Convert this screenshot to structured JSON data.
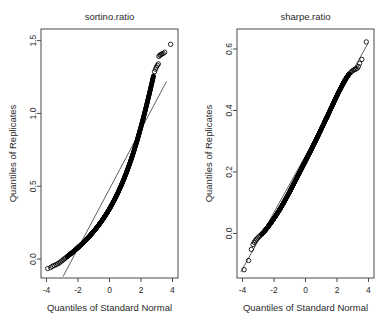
{
  "figure": {
    "background": "#ffffff",
    "point_color": "#000000",
    "line_color": "#1a1a1a",
    "axis_color": "#4a4a4a",
    "text_color": "#2b2b2b"
  },
  "chart_data": [
    {
      "type": "scatter",
      "plot_kind": "qq-plot",
      "title": "sortino.ratio",
      "xlabel": "Quantiles of Standard Normal",
      "ylabel": "Quantiles of Replicates",
      "xlim": [
        -4.35,
        4.35
      ],
      "ylim": [
        -0.13,
        1.58
      ],
      "xticks": [
        -4,
        -2,
        0,
        2,
        4
      ],
      "xticklabels": [
        "-4",
        "-2",
        "0",
        "2",
        "4"
      ],
      "yticks": [
        0.0,
        0.5,
        1.0,
        1.5
      ],
      "yticklabels": [
        "0.0",
        "0.5",
        "1.0",
        "1.5"
      ],
      "grid": false,
      "legend": null,
      "reference_line": {
        "x": [
          -2.95,
          3.62
        ],
        "y": [
          -0.12,
          1.22
        ]
      },
      "points": [
        [
          -3.92,
          -0.065
        ],
        [
          -3.74,
          -0.058
        ],
        [
          -3.62,
          -0.05
        ],
        [
          -3.52,
          -0.044
        ],
        [
          -3.4,
          -0.039
        ],
        [
          -3.3,
          -0.033
        ],
        [
          -3.21,
          -0.027
        ],
        [
          -3.12,
          -0.02
        ],
        [
          -3.02,
          -0.012
        ],
        [
          -2.94,
          -0.005
        ],
        [
          -2.86,
          0.002
        ],
        [
          -2.78,
          0.009
        ],
        [
          -2.7,
          0.016
        ],
        [
          -2.62,
          0.023
        ],
        [
          -2.54,
          0.03
        ],
        [
          -2.46,
          0.037
        ],
        [
          -2.38,
          0.044
        ],
        [
          -2.3,
          0.051
        ],
        [
          -2.22,
          0.058
        ],
        [
          -2.14,
          0.066
        ],
        [
          -2.06,
          0.073
        ],
        [
          -1.98,
          0.081
        ],
        [
          -1.9,
          0.089
        ],
        [
          -1.82,
          0.097
        ],
        [
          -1.74,
          0.105
        ],
        [
          -1.66,
          0.113
        ],
        [
          -1.58,
          0.122
        ],
        [
          -1.5,
          0.131
        ],
        [
          -1.42,
          0.14
        ],
        [
          -1.34,
          0.149
        ],
        [
          -1.26,
          0.158
        ],
        [
          -1.18,
          0.168
        ],
        [
          -1.1,
          0.178
        ],
        [
          -1.02,
          0.188
        ],
        [
          -0.94,
          0.198
        ],
        [
          -0.86,
          0.209
        ],
        [
          -0.78,
          0.22
        ],
        [
          -0.7,
          0.231
        ],
        [
          -0.62,
          0.243
        ],
        [
          -0.54,
          0.255
        ],
        [
          -0.46,
          0.267
        ],
        [
          -0.38,
          0.28
        ],
        [
          -0.3,
          0.293
        ],
        [
          -0.22,
          0.306
        ],
        [
          -0.14,
          0.32
        ],
        [
          -0.06,
          0.334
        ],
        [
          0.02,
          0.349
        ],
        [
          0.1,
          0.364
        ],
        [
          0.18,
          0.38
        ],
        [
          0.26,
          0.396
        ],
        [
          0.34,
          0.413
        ],
        [
          0.42,
          0.43
        ],
        [
          0.5,
          0.448
        ],
        [
          0.58,
          0.466
        ],
        [
          0.66,
          0.485
        ],
        [
          0.74,
          0.505
        ],
        [
          0.82,
          0.525
        ],
        [
          0.9,
          0.546
        ],
        [
          0.98,
          0.568
        ],
        [
          1.06,
          0.59
        ],
        [
          1.14,
          0.613
        ],
        [
          1.22,
          0.637
        ],
        [
          1.3,
          0.661
        ],
        [
          1.38,
          0.686
        ],
        [
          1.46,
          0.712
        ],
        [
          1.54,
          0.739
        ],
        [
          1.62,
          0.767
        ],
        [
          1.7,
          0.795
        ],
        [
          1.78,
          0.824
        ],
        [
          1.86,
          0.854
        ],
        [
          1.94,
          0.885
        ],
        [
          2.02,
          0.917
        ],
        [
          2.1,
          0.949
        ],
        [
          2.18,
          0.982
        ],
        [
          2.26,
          1.016
        ],
        [
          2.34,
          1.051
        ],
        [
          2.42,
          1.086
        ],
        [
          2.5,
          1.122
        ],
        [
          2.58,
          1.158
        ],
        [
          2.66,
          1.195
        ],
        [
          2.74,
          1.232
        ],
        [
          2.8,
          1.262
        ],
        [
          2.86,
          1.287
        ],
        [
          2.92,
          1.304
        ],
        [
          2.98,
          1.318
        ],
        [
          3.04,
          1.33
        ],
        [
          3.1,
          1.34
        ],
        [
          3.14,
          1.392
        ],
        [
          3.2,
          1.4
        ],
        [
          3.26,
          1.404
        ],
        [
          3.32,
          1.408
        ],
        [
          3.4,
          1.412
        ],
        [
          3.5,
          1.42
        ],
        [
          3.88,
          1.475
        ]
      ]
    },
    {
      "type": "scatter",
      "plot_kind": "qq-plot",
      "title": "sharpe.ratio",
      "xlabel": "Quantiles of Standard Normal",
      "ylabel": "Quantiles of Replicates",
      "xlim": [
        -4.35,
        4.35
      ],
      "ylim": [
        -0.145,
        0.665
      ],
      "xticks": [
        -4,
        -2,
        0,
        2,
        4
      ],
      "xticklabels": [
        "-4",
        "-2",
        "0",
        "2",
        "4"
      ],
      "yticks": [
        0.0,
        0.2,
        0.4,
        0.6
      ],
      "yticklabels": [
        "0.0",
        "0.2",
        "0.4",
        "0.6"
      ],
      "grid": false,
      "legend": null,
      "reference_line": {
        "x": [
          -4.1,
          3.95
        ],
        "y": [
          -0.125,
          0.617
        ]
      },
      "points": [
        [
          -3.9,
          -0.118
        ],
        [
          -3.62,
          -0.088
        ],
        [
          -3.44,
          -0.052
        ],
        [
          -3.33,
          -0.036
        ],
        [
          -3.26,
          -0.029
        ],
        [
          -3.19,
          -0.024
        ],
        [
          -3.12,
          -0.019
        ],
        [
          -3.04,
          -0.015
        ],
        [
          -2.96,
          -0.011
        ],
        [
          -2.88,
          -0.007
        ],
        [
          -2.8,
          -0.003
        ],
        [
          -2.72,
          0.001
        ],
        [
          -2.64,
          0.005
        ],
        [
          -2.56,
          0.01
        ],
        [
          -2.48,
          0.015
        ],
        [
          -2.4,
          0.02
        ],
        [
          -2.32,
          0.026
        ],
        [
          -2.24,
          0.031
        ],
        [
          -2.16,
          0.037
        ],
        [
          -2.08,
          0.043
        ],
        [
          -2.0,
          0.049
        ],
        [
          -1.92,
          0.055
        ],
        [
          -1.84,
          0.061
        ],
        [
          -1.76,
          0.068
        ],
        [
          -1.68,
          0.074
        ],
        [
          -1.6,
          0.081
        ],
        [
          -1.52,
          0.088
        ],
        [
          -1.44,
          0.095
        ],
        [
          -1.36,
          0.102
        ],
        [
          -1.28,
          0.11
        ],
        [
          -1.2,
          0.117
        ],
        [
          -1.12,
          0.125
        ],
        [
          -1.04,
          0.132
        ],
        [
          -0.96,
          0.14
        ],
        [
          -0.88,
          0.148
        ],
        [
          -0.8,
          0.156
        ],
        [
          -0.72,
          0.164
        ],
        [
          -0.64,
          0.172
        ],
        [
          -0.56,
          0.18
        ],
        [
          -0.48,
          0.188
        ],
        [
          -0.4,
          0.196
        ],
        [
          -0.32,
          0.204
        ],
        [
          -0.24,
          0.212
        ],
        [
          -0.16,
          0.22
        ],
        [
          -0.08,
          0.228
        ],
        [
          0.0,
          0.236
        ],
        [
          0.08,
          0.244
        ],
        [
          0.16,
          0.252
        ],
        [
          0.24,
          0.26
        ],
        [
          0.32,
          0.268
        ],
        [
          0.4,
          0.276
        ],
        [
          0.48,
          0.285
        ],
        [
          0.56,
          0.293
        ],
        [
          0.64,
          0.301
        ],
        [
          0.72,
          0.31
        ],
        [
          0.8,
          0.318
        ],
        [
          0.88,
          0.327
        ],
        [
          0.96,
          0.335
        ],
        [
          1.04,
          0.344
        ],
        [
          1.12,
          0.352
        ],
        [
          1.2,
          0.361
        ],
        [
          1.28,
          0.37
        ],
        [
          1.36,
          0.378
        ],
        [
          1.44,
          0.387
        ],
        [
          1.52,
          0.396
        ],
        [
          1.6,
          0.405
        ],
        [
          1.68,
          0.413
        ],
        [
          1.76,
          0.422
        ],
        [
          1.84,
          0.431
        ],
        [
          1.92,
          0.44
        ],
        [
          2.0,
          0.448
        ],
        [
          2.08,
          0.457
        ],
        [
          2.16,
          0.465
        ],
        [
          2.24,
          0.473
        ],
        [
          2.32,
          0.481
        ],
        [
          2.4,
          0.489
        ],
        [
          2.48,
          0.496
        ],
        [
          2.56,
          0.503
        ],
        [
          2.64,
          0.509
        ],
        [
          2.72,
          0.515
        ],
        [
          2.8,
          0.52
        ],
        [
          2.88,
          0.524
        ],
        [
          2.96,
          0.528
        ],
        [
          3.04,
          0.531
        ],
        [
          3.12,
          0.533
        ],
        [
          3.2,
          0.535
        ],
        [
          3.28,
          0.537
        ],
        [
          3.36,
          0.543
        ],
        [
          3.44,
          0.553
        ],
        [
          3.58,
          0.566
        ],
        [
          3.86,
          0.623
        ]
      ]
    }
  ]
}
